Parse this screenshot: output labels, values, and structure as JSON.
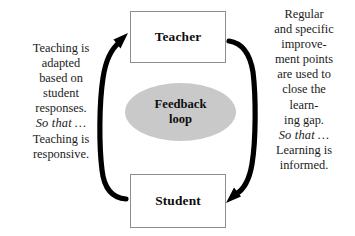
{
  "diagram": {
    "colors": {
      "ellipse_fill": "#c9c9c9",
      "box_border": "#8d8d8d",
      "arrow": "#000000",
      "text": "#1b1b1b",
      "background": "#ffffff"
    },
    "nodes": {
      "teacher": "Teacher",
      "student": "Student",
      "feedback_line1": "Feedback",
      "feedback_line2": "loop"
    },
    "left_text": {
      "lines": [
        "Teaching is",
        "adapted",
        "based on",
        "student",
        "responses."
      ],
      "connector": "So that …",
      "outcome_lines": [
        "Teaching is",
        "responsive."
      ]
    },
    "right_text": {
      "lines": [
        "Regular",
        "and specific",
        "improve-",
        "ment points",
        "are used to",
        "close the",
        "learn-",
        "ing gap."
      ],
      "connector": "So that …",
      "outcome_lines": [
        "Learning is",
        "informed."
      ]
    },
    "arrows": {
      "left": "student-to-teacher-arrow",
      "right": "teacher-to-student-arrow"
    }
  }
}
